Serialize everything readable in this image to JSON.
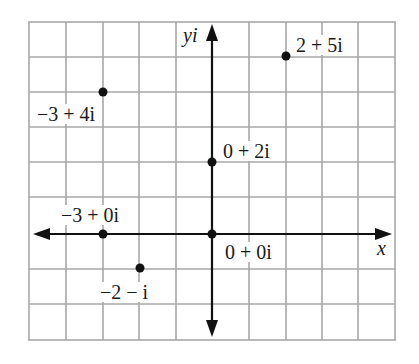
{
  "diagram": {
    "title": "",
    "type": "complex-plane",
    "axes": {
      "x_label": "x",
      "y_label": "yi",
      "x_range": [
        -5,
        5
      ],
      "y_range": [
        -3,
        6
      ],
      "grid": true
    },
    "points": [
      {
        "label": "2 + 5i",
        "re": 2,
        "im": 5
      },
      {
        "label": "−3 + 4i",
        "re": -3,
        "im": 4
      },
      {
        "label": "0 + 2i",
        "re": 0,
        "im": 2
      },
      {
        "label": "−3 + 0i",
        "re": -3,
        "im": 0
      },
      {
        "label": "0 + 0i",
        "re": 0,
        "im": 0
      },
      {
        "label": "−2 − i",
        "re": -2,
        "im": -1
      }
    ],
    "colors": {
      "grid": "#a8a8a8",
      "axis": "#111111",
      "point": "#111111",
      "text": "#1a1a1a"
    }
  }
}
